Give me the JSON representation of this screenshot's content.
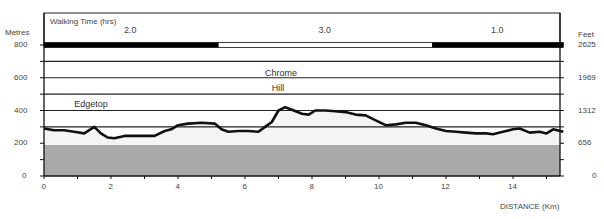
{
  "chart_data": {
    "type": "area",
    "title": "Walking Time (hrs)",
    "xlabel": "DISTANCE (Km)",
    "ylabel_left": "Metres",
    "ylabel_right": "Feet",
    "xlim": [
      0,
      15.5
    ],
    "ylim": [
      0,
      800
    ],
    "x_ticks": [
      0,
      2,
      4,
      6,
      8,
      10,
      12,
      14
    ],
    "x_minor_ticks": [
      1,
      3,
      5,
      7,
      9,
      11,
      13,
      15
    ],
    "y_ticks_left": [
      0,
      200,
      400,
      600,
      800
    ],
    "y_ticks_right": [
      {
        "label": "0",
        "metres": 0
      },
      {
        "label": "656",
        "metres": 200
      },
      {
        "label": "1312",
        "metres": 400
      },
      {
        "label": "1969",
        "metres": 600
      },
      {
        "label": "2625",
        "metres": 800
      }
    ],
    "gridlines_metres": [
      300,
      400,
      500,
      600,
      700,
      800
    ],
    "base_band_metres": 190,
    "walking_time": [
      {
        "label": "2.0",
        "from_km": 0,
        "to_km": 5.2,
        "fill": "#000000"
      },
      {
        "label": "3.0",
        "from_km": 5.2,
        "to_km": 11.6,
        "fill": "#ffffff"
      },
      {
        "label": "1.0",
        "from_km": 11.6,
        "to_km": 15.5,
        "fill": "#000000"
      }
    ],
    "annotations": [
      {
        "text": "Edgetop",
        "x_km": 0.9,
        "y_m": 440
      },
      {
        "text": "Chrome",
        "x_km": 6.6,
        "y_m": 630
      },
      {
        "text": "Hill",
        "x_km": 6.8,
        "y_m": 540
      }
    ],
    "profile": {
      "x": [
        0,
        0.3,
        0.6,
        0.9,
        1.2,
        1.5,
        1.7,
        1.9,
        2.1,
        2.4,
        2.7,
        3.0,
        3.3,
        3.6,
        3.8,
        4.0,
        4.3,
        4.7,
        5.1,
        5.3,
        5.5,
        5.8,
        6.1,
        6.4,
        6.6,
        6.8,
        7.0,
        7.2,
        7.4,
        7.7,
        7.9,
        8.1,
        8.4,
        8.7,
        9.0,
        9.3,
        9.6,
        9.9,
        10.2,
        10.5,
        10.8,
        11.1,
        11.4,
        11.7,
        12.0,
        12.3,
        12.6,
        12.9,
        13.2,
        13.4,
        13.7,
        14.0,
        14.2,
        14.5,
        14.8,
        15.0,
        15.2,
        15.5
      ],
      "values": [
        290,
        280,
        280,
        270,
        260,
        300,
        260,
        235,
        230,
        245,
        245,
        245,
        245,
        275,
        285,
        310,
        320,
        325,
        320,
        285,
        270,
        275,
        275,
        270,
        300,
        330,
        400,
        420,
        405,
        380,
        375,
        400,
        400,
        395,
        390,
        375,
        370,
        340,
        310,
        315,
        325,
        325,
        310,
        290,
        275,
        270,
        265,
        260,
        260,
        255,
        270,
        285,
        290,
        265,
        270,
        260,
        285,
        270
      ]
    }
  }
}
